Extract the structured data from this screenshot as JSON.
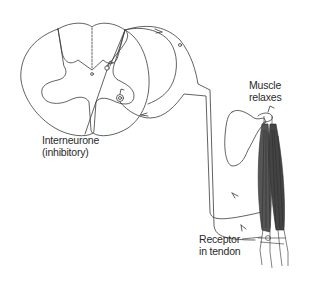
{
  "figure": {
    "type": "anatomical-diagram",
    "colors": {
      "line": "#3a3a3a",
      "muscle": "#2e2e2e",
      "background": "#ffffff"
    }
  },
  "labels": {
    "interneurone": {
      "line1": "Interneurone",
      "line2": "(inhibitory)"
    },
    "muscle": {
      "line1": "Muscle",
      "line2": "relaxes"
    },
    "receptor": {
      "line1": "Receptor",
      "line2": "in tendon"
    }
  }
}
